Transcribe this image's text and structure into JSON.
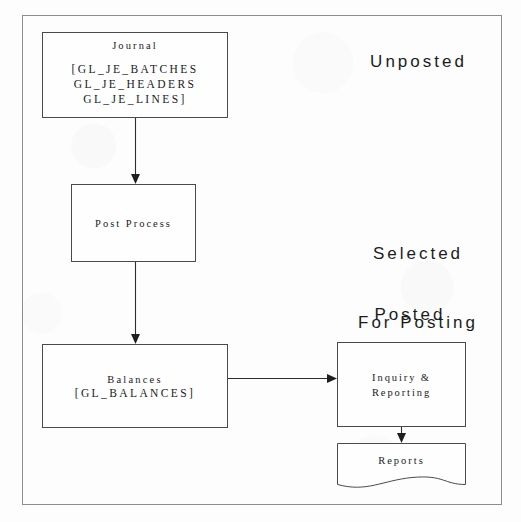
{
  "diagram": {
    "frame": {
      "border_color": "#8d8d8d"
    },
    "nodes": {
      "journal": {
        "title": "Journal",
        "tables_line1": "[GL_JE_BATCHES",
        "tables_line2": "GL_JE_HEADERS",
        "tables_line3": "GL_JE_LINES]"
      },
      "post_process": {
        "title": "Post Process"
      },
      "balances": {
        "title": "Balances",
        "tables_line1": "[GL_BALANCES]"
      },
      "inquiry": {
        "title_line1": "Inquiry &",
        "title_line2": "Reporting"
      },
      "reports": {
        "title": "Reports"
      }
    },
    "stage_labels": {
      "unposted": "Unposted",
      "selected_line1": "Selected",
      "selected_line2": "For Posting",
      "posted": "Posted"
    },
    "edges": [
      {
        "name": "journal-to-post-process",
        "from": "journal",
        "to": "post_process",
        "direction": "down"
      },
      {
        "name": "post-process-to-balances",
        "from": "post_process",
        "to": "balances",
        "direction": "down"
      },
      {
        "name": "balances-to-inquiry",
        "from": "balances",
        "to": "inquiry",
        "direction": "right"
      },
      {
        "name": "inquiry-to-reports",
        "from": "inquiry",
        "to": "reports",
        "direction": "down"
      }
    ],
    "colors": {
      "node_border": "#4a4a4a",
      "edge_stroke": "#2e2e2e",
      "text": "#1a1a1a",
      "background": "#fdfdfd"
    }
  }
}
